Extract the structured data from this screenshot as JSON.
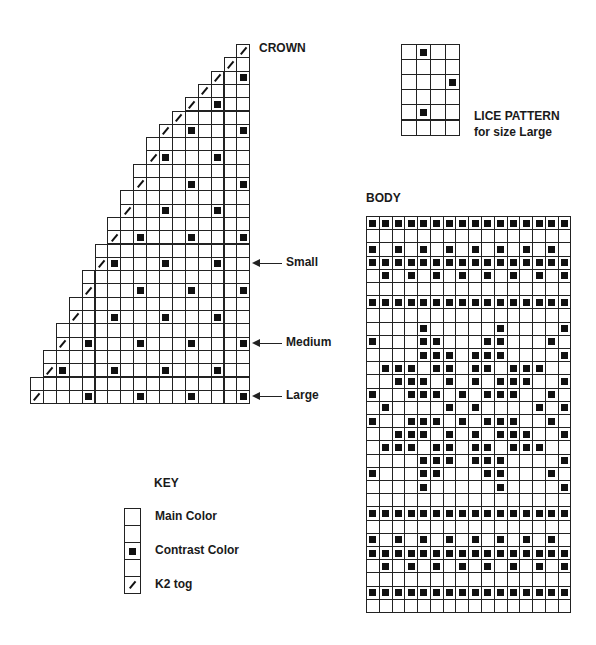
{
  "crown": {
    "title": "CROWN",
    "columns": 17,
    "rows": [
      {
        "width": 1,
        "k2": 16,
        "cc": []
      },
      {
        "width": 2,
        "k2": 15,
        "cc": []
      },
      {
        "width": 3,
        "k2": 14,
        "cc": [
          16
        ]
      },
      {
        "width": 4,
        "k2": 13,
        "cc": []
      },
      {
        "width": 5,
        "k2": 12,
        "cc": [
          14
        ]
      },
      {
        "width": 6,
        "k2": 11,
        "cc": []
      },
      {
        "width": 7,
        "k2": 10,
        "cc": [
          12,
          16
        ]
      },
      {
        "width": 8,
        "k2": null,
        "cc": []
      },
      {
        "width": 8,
        "k2": 9,
        "cc": [
          10,
          14
        ]
      },
      {
        "width": 9,
        "k2": null,
        "cc": []
      },
      {
        "width": 9,
        "k2": 8,
        "cc": [
          12,
          16
        ]
      },
      {
        "width": 10,
        "k2": null,
        "cc": []
      },
      {
        "width": 10,
        "k2": 7,
        "cc": [
          10,
          14
        ]
      },
      {
        "width": 11,
        "k2": null,
        "cc": []
      },
      {
        "width": 11,
        "k2": 6,
        "cc": [
          8,
          12,
          16
        ]
      },
      {
        "width": 12,
        "k2": null,
        "cc": []
      },
      {
        "width": 12,
        "k2": 5,
        "cc": [
          6,
          10,
          14
        ]
      },
      {
        "width": 13,
        "k2": null,
        "cc": []
      },
      {
        "width": 13,
        "k2": 4,
        "cc": [
          8,
          12,
          16
        ]
      },
      {
        "width": 14,
        "k2": null,
        "cc": []
      },
      {
        "width": 14,
        "k2": 3,
        "cc": [
          6,
          10,
          14
        ]
      },
      {
        "width": 15,
        "k2": null,
        "cc": []
      },
      {
        "width": 15,
        "k2": 2,
        "cc": [
          4,
          8,
          12,
          16
        ]
      },
      {
        "width": 16,
        "k2": null,
        "cc": []
      },
      {
        "width": 16,
        "k2": 1,
        "cc": [
          2,
          6,
          10,
          14
        ]
      },
      {
        "width": 17,
        "k2": null,
        "cc": []
      },
      {
        "width": 17,
        "k2": 0,
        "cc": [
          4,
          8,
          12,
          16
        ]
      }
    ],
    "size_markers": [
      {
        "label": "Small",
        "row": 16
      },
      {
        "label": "Medium",
        "row": 22
      },
      {
        "label": "Large",
        "row": 26
      }
    ]
  },
  "lice": {
    "title_line1": "LICE PATTERN",
    "title_line2": "for size Large",
    "columns": 4,
    "rows": [
      [
        1
      ],
      [],
      [
        3
      ],
      [],
      [
        1
      ],
      []
    ]
  },
  "body": {
    "title": "BODY",
    "columns": 16,
    "rows": [
      [
        0,
        1,
        2,
        3,
        4,
        5,
        6,
        7,
        8,
        9,
        10,
        11,
        12,
        13,
        14,
        15
      ],
      [],
      [
        0,
        2,
        4,
        6,
        8,
        10,
        12,
        14
      ],
      [
        0,
        1,
        2,
        3,
        4,
        5,
        6,
        7,
        8,
        9,
        10,
        11,
        12,
        13,
        14,
        15
      ],
      [
        1,
        3,
        5,
        7,
        9,
        11,
        13,
        15
      ],
      [],
      [
        0,
        1,
        2,
        3,
        4,
        5,
        6,
        7,
        8,
        9,
        10,
        11,
        12,
        13,
        14,
        15
      ],
      [],
      [
        4,
        10,
        15
      ],
      [
        0,
        4,
        5,
        9,
        10,
        14
      ],
      [
        4,
        5,
        6,
        8,
        9,
        10,
        15
      ],
      [
        1,
        2,
        3,
        5,
        6,
        8,
        9,
        11,
        12,
        13
      ],
      [
        2,
        3,
        4,
        6,
        8,
        10,
        11,
        12,
        15
      ],
      [
        0,
        3,
        4,
        5,
        7,
        9,
        10,
        11,
        14
      ],
      [
        1,
        6,
        8,
        13,
        15
      ],
      [
        0,
        3,
        4,
        5,
        7,
        9,
        10,
        11,
        14
      ],
      [
        2,
        3,
        4,
        6,
        8,
        10,
        11,
        12,
        15
      ],
      [
        1,
        2,
        3,
        5,
        6,
        8,
        9,
        11,
        12,
        13
      ],
      [
        4,
        5,
        6,
        8,
        9,
        10,
        15
      ],
      [
        0,
        4,
        5,
        9,
        10,
        14
      ],
      [
        4,
        10,
        15
      ],
      [],
      [
        0,
        1,
        2,
        3,
        4,
        5,
        6,
        7,
        8,
        9,
        10,
        11,
        12,
        13,
        14,
        15
      ],
      [],
      [
        0,
        2,
        4,
        6,
        8,
        10,
        12,
        14
      ],
      [
        0,
        1,
        2,
        3,
        4,
        5,
        6,
        7,
        8,
        9,
        10,
        11,
        12,
        13,
        14,
        15
      ],
      [
        1,
        3,
        5,
        7,
        9,
        11,
        13,
        15
      ],
      [],
      [
        0,
        1,
        2,
        3,
        4,
        5,
        6,
        7,
        8,
        9,
        10,
        11,
        12,
        13,
        14,
        15
      ],
      []
    ]
  },
  "key": {
    "title": "KEY",
    "cells": [
      "main",
      "main",
      "cc",
      "main",
      "k2"
    ],
    "items": [
      {
        "label": "Main Color",
        "cell": 0
      },
      {
        "label": "Contrast Color",
        "cell": 2
      },
      {
        "label": "K2 tog",
        "cell": 4
      }
    ]
  }
}
